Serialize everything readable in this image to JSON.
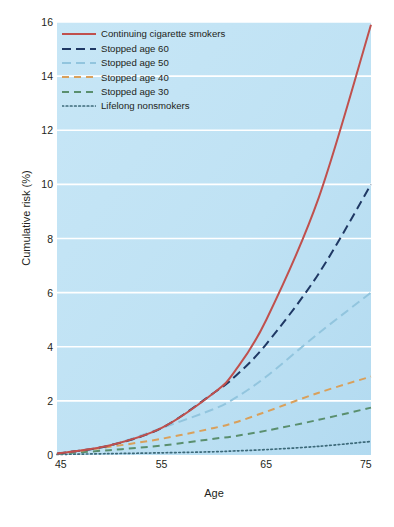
{
  "chart_data": {
    "type": "line",
    "title": "",
    "xlabel": "Age",
    "ylabel": "Cumulative risk (%)",
    "xlim": [
      45,
      75
    ],
    "ylim": [
      0,
      16
    ],
    "xticks": [
      45,
      55,
      65,
      75
    ],
    "yticks": [
      0,
      2,
      4,
      6,
      8,
      10,
      12,
      14,
      16
    ],
    "grid": "horizontal",
    "legend_position": "top-left",
    "plot_background": "#bfe2f4",
    "x": [
      45,
      50,
      55,
      60,
      62,
      65,
      70,
      75
    ],
    "series": [
      {
        "name": "Continuing cigarette smokers",
        "color": "#c0504d",
        "dash": "solid",
        "values": [
          0.05,
          0.35,
          1.0,
          2.3,
          3.1,
          5.0,
          9.5,
          15.9
        ]
      },
      {
        "name": "Stopped age 60",
        "color": "#1f3864",
        "dash": "long-dash",
        "values": [
          0.05,
          0.35,
          1.0,
          2.3,
          2.9,
          4.1,
          6.7,
          10.0
        ]
      },
      {
        "name": "Stopped age 50",
        "color": "#92c5de",
        "dash": "long-dash",
        "values": [
          0.05,
          0.35,
          1.0,
          1.7,
          2.1,
          2.9,
          4.5,
          6.0
        ]
      },
      {
        "name": "Stopped age 40",
        "color": "#d9a05b",
        "dash": "dash",
        "values": [
          0.05,
          0.3,
          0.6,
          1.0,
          1.2,
          1.6,
          2.3,
          2.9
        ]
      },
      {
        "name": "Stopped age 30",
        "color": "#5a8f6e",
        "dash": "dash",
        "values": [
          0.04,
          0.18,
          0.35,
          0.6,
          0.7,
          0.9,
          1.3,
          1.75
        ]
      },
      {
        "name": "Lifelong nonsmokers",
        "color": "#3d6a7a",
        "dash": "dotted",
        "values": [
          0.02,
          0.05,
          0.08,
          0.12,
          0.15,
          0.2,
          0.32,
          0.5
        ]
      }
    ]
  },
  "axes": {
    "ylabel": "Cumulative risk (%)",
    "xlabel": "Age",
    "ytick_labels": [
      "16",
      "14",
      "12",
      "10",
      "8",
      "6",
      "4",
      "2",
      "0"
    ],
    "xtick_labels": [
      "45",
      "55",
      "65",
      "75"
    ]
  },
  "legend": {
    "items": [
      {
        "label": "Continuing cigarette smokers",
        "color": "#c0504d",
        "dash": "solid"
      },
      {
        "label": "Stopped age 60",
        "color": "#1f3864",
        "dash": "long-dash"
      },
      {
        "label": "Stopped age 50",
        "color": "#92c5de",
        "dash": "long-dash"
      },
      {
        "label": "Stopped age 40",
        "color": "#d9a05b",
        "dash": "dash"
      },
      {
        "label": "Stopped age 30",
        "color": "#5a8f6e",
        "dash": "dash"
      },
      {
        "label": "Lifelong nonsmokers",
        "color": "#3d6a7a",
        "dash": "dotted"
      }
    ]
  }
}
